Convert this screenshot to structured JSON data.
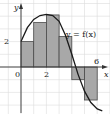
{
  "chart_data": {
    "type": "bar",
    "title": "",
    "xlabel": "x",
    "ylabel": "y",
    "curve_label": "y = f(x)",
    "x_ticks": [
      {
        "value": 0,
        "label": "0"
      },
      {
        "value": 2,
        "label": "2"
      },
      {
        "value": 6,
        "label": "6"
      }
    ],
    "y_ticks": [
      {
        "value": 2,
        "label": "2"
      }
    ],
    "xlim": [
      -1.5,
      7
    ],
    "ylim": [
      -3.7,
      5.2
    ],
    "grid": true,
    "categories": [
      "[0,1]",
      "[1,2]",
      "[2,3]",
      "[3,4]",
      "[4,5]",
      "[5,6]"
    ],
    "values": [
      2,
      3.5,
      4.1,
      2.4,
      -1,
      -2.6
    ],
    "rectangles": [
      {
        "x0": 0,
        "x1": 1,
        "height": 2
      },
      {
        "x0": 1,
        "x1": 2,
        "height": 3.5
      },
      {
        "x0": 2,
        "x1": 3,
        "height": 4.1
      },
      {
        "x0": 3,
        "x1": 4,
        "height": 2.4
      },
      {
        "x0": 4,
        "x1": 5,
        "height": -1
      },
      {
        "x0": 5,
        "x1": 6,
        "height": -2.6
      }
    ],
    "curve_points": [
      [
        0,
        2
      ],
      [
        0.5,
        3.1
      ],
      [
        1,
        3.75
      ],
      [
        1.5,
        4.05
      ],
      [
        2,
        4.15
      ],
      [
        2.5,
        4.05
      ],
      [
        3,
        3.6
      ],
      [
        3.5,
        2.5
      ],
      [
        4,
        1.0
      ],
      [
        4.5,
        -0.6
      ],
      [
        5,
        -1.9
      ],
      [
        5.5,
        -2.8
      ],
      [
        6,
        -3.3
      ],
      [
        6.4,
        -3.45
      ]
    ],
    "colors": {
      "rect_fill": "#a8a8a8",
      "rect_stroke": "#4a4a4a",
      "curve": "#1a1a1a",
      "grid": "#dcdcdc",
      "axis": "#333333"
    }
  }
}
